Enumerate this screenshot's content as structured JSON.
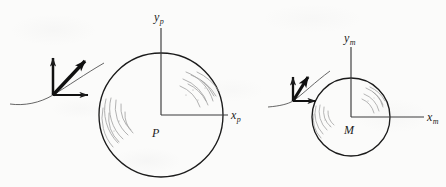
{
  "figure": {
    "background_color": "#fbfbfa",
    "ink_color": "#1b1b1b",
    "hatch_color": "#9a9a9a",
    "width": 446,
    "height": 187
  },
  "bodies": [
    {
      "id": "primary",
      "label": "P",
      "center": {
        "x": 161,
        "y": 115
      },
      "radius": 62,
      "label_position": {
        "x": 152,
        "y": 133
      }
    },
    {
      "id": "secondary",
      "label": "M",
      "center": {
        "x": 351,
        "y": 117
      },
      "radius": 39,
      "label_position": {
        "x": 344,
        "y": 130
      }
    }
  ],
  "axes": [
    {
      "id": "primary-frame",
      "origin": {
        "x": 161,
        "y": 115
      },
      "y_axis": {
        "label_base": "y",
        "label_sub": "p",
        "tip": {
          "x": 161,
          "y": 28
        },
        "label_x": 154,
        "label_y": 12
      },
      "x_axis": {
        "label_base": "x",
        "label_sub": "p",
        "tip": {
          "x": 228,
          "y": 115
        },
        "label_x": 231,
        "label_y": 110
      }
    },
    {
      "id": "secondary-frame",
      "origin": {
        "x": 351,
        "y": 117
      },
      "y_axis": {
        "label_base": "y",
        "label_sub": "m",
        "tip": {
          "x": 351,
          "y": 47
        },
        "label_x": 344,
        "label_y": 33
      },
      "x_axis": {
        "label_base": "x",
        "label_sub": "m",
        "tip": {
          "x": 424,
          "y": 117
        },
        "label_x": 427,
        "label_y": 112
      }
    }
  ],
  "vector_clusters": [
    {
      "id": "primary-vectors",
      "origin": {
        "x": 53,
        "y": 95
      },
      "vertical_arrow_tip": {
        "x": 53,
        "y": 54
      },
      "horizontal_arrow_tip": {
        "x": 92,
        "y": 95
      },
      "diagonal_arrow_tip": {
        "x": 90,
        "y": 56
      },
      "trajectory_description": "thin curve through origin rising to the right"
    },
    {
      "id": "secondary-vectors",
      "origin": {
        "x": 293,
        "y": 101
      },
      "vertical_arrow_tip": {
        "x": 293,
        "y": 74
      },
      "horizontal_arrow_tip": {
        "x": 319,
        "y": 101
      },
      "diagonal_arrow_tip": {
        "x": 311,
        "y": 73
      },
      "trajectory_description": "thin curve through origin rising to the right"
    }
  ],
  "hatching": {
    "description": "faint concentric arc shading marks inside each circle",
    "regions": [
      "primary-upper-right",
      "primary-left",
      "secondary-upper-right",
      "secondary-left"
    ]
  }
}
